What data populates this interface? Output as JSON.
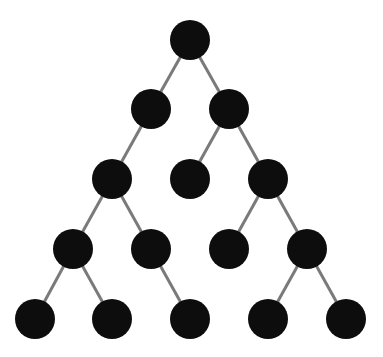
{
  "diagram": {
    "type": "tree",
    "colors": {
      "node": "#0d0d0d",
      "edge": "#7a7a7a",
      "background": "#ffffff"
    },
    "node_radius": 20,
    "nodes": [
      {
        "id": "n0",
        "x": 190,
        "y": 40
      },
      {
        "id": "n1",
        "x": 151,
        "y": 109
      },
      {
        "id": "n2",
        "x": 229,
        "y": 109
      },
      {
        "id": "n3",
        "x": 112,
        "y": 179
      },
      {
        "id": "n4",
        "x": 190,
        "y": 179
      },
      {
        "id": "n5",
        "x": 268,
        "y": 179
      },
      {
        "id": "n6",
        "x": 73,
        "y": 249
      },
      {
        "id": "n7",
        "x": 151,
        "y": 249
      },
      {
        "id": "n8",
        "x": 229,
        "y": 249
      },
      {
        "id": "n9",
        "x": 307,
        "y": 249
      },
      {
        "id": "n10",
        "x": 35,
        "y": 319
      },
      {
        "id": "n11",
        "x": 112,
        "y": 319
      },
      {
        "id": "n12",
        "x": 190,
        "y": 319
      },
      {
        "id": "n13",
        "x": 268,
        "y": 319
      },
      {
        "id": "n14",
        "x": 346,
        "y": 319
      }
    ],
    "edges": [
      [
        "n0",
        "n1"
      ],
      [
        "n0",
        "n2"
      ],
      [
        "n1",
        "n3"
      ],
      [
        "n2",
        "n4"
      ],
      [
        "n2",
        "n5"
      ],
      [
        "n3",
        "n6"
      ],
      [
        "n3",
        "n7"
      ],
      [
        "n5",
        "n8"
      ],
      [
        "n5",
        "n9"
      ],
      [
        "n6",
        "n10"
      ],
      [
        "n6",
        "n11"
      ],
      [
        "n7",
        "n12"
      ],
      [
        "n9",
        "n13"
      ],
      [
        "n9",
        "n14"
      ]
    ]
  }
}
